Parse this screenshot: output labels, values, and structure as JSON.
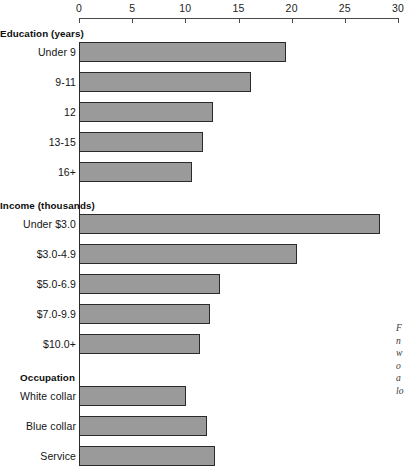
{
  "chart_data": {
    "type": "bar",
    "orientation": "horizontal",
    "title": "",
    "xlabel": "",
    "ylabel": "",
    "xlim": [
      0,
      30
    ],
    "xticks": [
      0,
      5,
      10,
      15,
      20,
      25,
      30
    ],
    "xtick_labels": [
      "0",
      "5",
      "10",
      "15",
      "20",
      "25",
      "30"
    ],
    "grid": false,
    "legend": false,
    "bar_color": "#9a9a9a",
    "bar_edge_color": "#2a2a2a",
    "groups": [
      {
        "name": "Education (years)",
        "categories": [
          "Under 9",
          "9-11",
          "12",
          "13-15",
          "16+"
        ],
        "values": [
          19.5,
          16.2,
          12.6,
          11.7,
          10.6
        ]
      },
      {
        "name": "Income (thousands)",
        "categories": [
          "Under $3.0",
          "$3.0-4.9",
          "$5.0-6.9",
          "$7.0-9.9",
          "$10.0+"
        ],
        "values": [
          28.3,
          20.5,
          13.3,
          12.3,
          11.4
        ]
      },
      {
        "name": "Occupation",
        "categories": [
          "White collar",
          "Blue collar",
          "Service"
        ],
        "values": [
          10.1,
          12.0,
          12.8
        ]
      }
    ]
  },
  "axis": {
    "ticks": [
      {
        "label": "0",
        "value": 0
      },
      {
        "label": "5",
        "value": 5
      },
      {
        "label": "10",
        "value": 10
      },
      {
        "label": "15",
        "value": 15
      },
      {
        "label": "20",
        "value": 20
      },
      {
        "label": "25",
        "value": 25
      },
      {
        "label": "30",
        "value": 30
      }
    ]
  },
  "caption": {
    "lines": [
      "F",
      "n",
      "w",
      "o",
      "a",
      "lo"
    ]
  }
}
